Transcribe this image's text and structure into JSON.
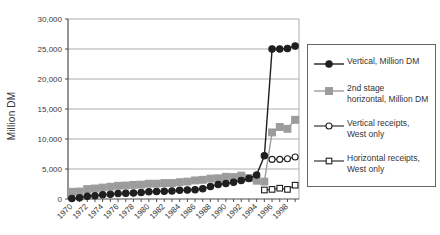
{
  "colors": {
    "background": "#ffffff",
    "series_black": "#1f1f1f",
    "series_gray": "#9c9c9c",
    "grid": "#adadad",
    "axis": "#4d4d4d",
    "text": "#3a3a3a",
    "legend_border": "#666666"
  },
  "chart_data": {
    "type": "line",
    "title": "",
    "xlabel": "",
    "ylabel": "Million DM",
    "ylim": [
      0,
      30000
    ],
    "ytick_interval": 5000,
    "ytick_labels": [
      "0",
      "5,000",
      "10,000",
      "15,000",
      "20,000",
      "25,000",
      "30,000"
    ],
    "grid": true,
    "legend_position": "right",
    "x": [
      1970,
      1971,
      1972,
      1973,
      1974,
      1975,
      1976,
      1977,
      1978,
      1979,
      1980,
      1981,
      1982,
      1983,
      1984,
      1985,
      1986,
      1987,
      1988,
      1989,
      1990,
      1991,
      1992,
      1993,
      1994,
      1995,
      1996,
      1997,
      1998,
      1999
    ],
    "xtick_labels": [
      "1970",
      "1972",
      "1974",
      "1976",
      "1978",
      "1980",
      "1982",
      "1984",
      "1986",
      "1988",
      "1990",
      "1992",
      "1994",
      "1996",
      "1998"
    ],
    "series": [
      {
        "id": "vertical",
        "name": "Vertical, Million DM",
        "legend_label": "Vertical, Million DM",
        "marker": "circle",
        "fill": "filled",
        "color": "#1f1f1f",
        "line_width": 1.4,
        "marker_size": 3.2,
        "values": [
          100,
          200,
          450,
          550,
          700,
          800,
          900,
          950,
          1000,
          1100,
          1200,
          1250,
          1300,
          1350,
          1450,
          1500,
          1550,
          1700,
          2100,
          2400,
          2600,
          2800,
          3100,
          3400,
          4000,
          7200,
          25000,
          25000,
          25100,
          25500
        ]
      },
      {
        "id": "second-stage-horizontal",
        "name": "2nd stage horizontal, Million DM",
        "legend_label": "2nd stage\nhorizontal, Million DM",
        "marker": "square",
        "fill": "filled",
        "color": "#9c9c9c",
        "line_width": 1.4,
        "marker_size": 3.4,
        "values": [
          1200,
          1250,
          1650,
          1750,
          1900,
          2050,
          2200,
          2250,
          2350,
          2400,
          2550,
          2550,
          2650,
          2650,
          2800,
          2900,
          3100,
          3200,
          3400,
          3450,
          3700,
          3650,
          3900,
          3500,
          3050,
          2900,
          11100,
          12000,
          11700,
          13200
        ]
      },
      {
        "id": "vertical-receipts-west",
        "name": "Vertical receipts, West only",
        "legend_label": "Vertical receipts,\nWest only",
        "marker": "circle",
        "fill": "open",
        "color": "#1f1f1f",
        "line_width": 1.1,
        "marker_size": 3.0,
        "values": [
          null,
          null,
          null,
          null,
          null,
          null,
          null,
          null,
          null,
          null,
          null,
          null,
          null,
          null,
          null,
          null,
          null,
          null,
          null,
          null,
          null,
          null,
          null,
          null,
          null,
          null,
          6600,
          6600,
          6700,
          7000
        ]
      },
      {
        "id": "horizontal-receipts-west",
        "name": "Horizontal receipts, West only",
        "legend_label": "Horizontal receipts,\nWest only",
        "marker": "square",
        "fill": "open",
        "color": "#1f1f1f",
        "line_width": 1.1,
        "marker_size": 2.8,
        "values": [
          null,
          null,
          null,
          null,
          null,
          null,
          null,
          null,
          null,
          null,
          null,
          null,
          null,
          null,
          null,
          null,
          null,
          null,
          null,
          null,
          null,
          null,
          null,
          null,
          null,
          1500,
          1600,
          1800,
          1600,
          2300
        ]
      }
    ]
  }
}
